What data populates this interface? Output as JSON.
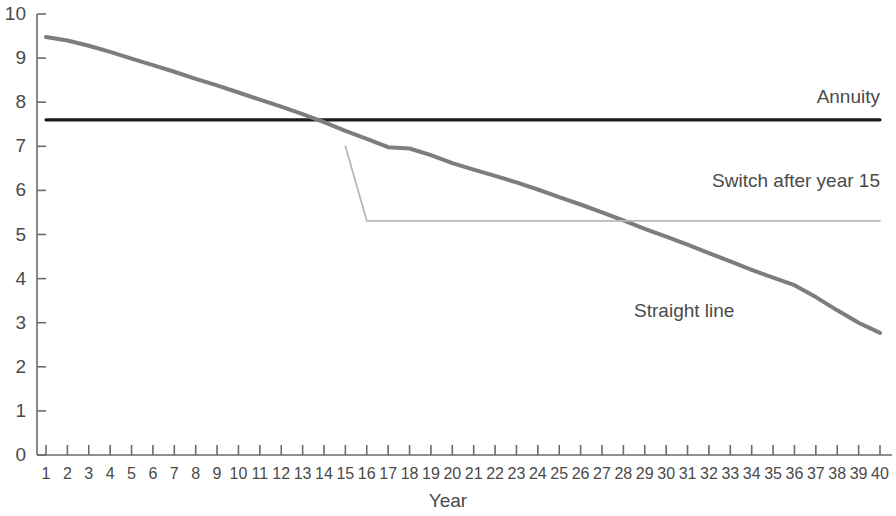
{
  "chart_data": {
    "type": "line",
    "title": "",
    "xlabel": "Year",
    "ylabel": "",
    "xlim": [
      1,
      40
    ],
    "ylim": [
      0,
      10
    ],
    "grid": false,
    "legend_position": "inline-annotations",
    "x": [
      1,
      2,
      3,
      4,
      5,
      6,
      7,
      8,
      9,
      10,
      11,
      12,
      13,
      14,
      15,
      16,
      17,
      18,
      19,
      20,
      21,
      22,
      23,
      24,
      25,
      26,
      27,
      28,
      29,
      30,
      31,
      32,
      33,
      34,
      35,
      36,
      37,
      38,
      39,
      40
    ],
    "xtick_labels": [
      "1",
      "2",
      "3",
      "4",
      "5",
      "6",
      "7",
      "8",
      "9",
      "10",
      "11",
      "12",
      "13",
      "14",
      "15",
      "16",
      "17",
      "18",
      "19",
      "20",
      "21",
      "22",
      "23",
      "24",
      "25",
      "26",
      "27",
      "28",
      "29",
      "30",
      "31",
      "32",
      "33",
      "34",
      "35",
      "36",
      "37",
      "38",
      "39",
      "40"
    ],
    "ytick_labels": [
      "0",
      "1",
      "2",
      "3",
      "4",
      "5",
      "6",
      "7",
      "8",
      "9",
      "10"
    ],
    "ytick_values": [
      0,
      1,
      2,
      3,
      4,
      5,
      6,
      7,
      8,
      9,
      10
    ],
    "series": [
      {
        "name": "Annuity",
        "color": "#1a1a1a",
        "width": 3.2,
        "label_x": 40,
        "label_y": 8.1,
        "values": [
          7.6,
          7.6,
          7.6,
          7.6,
          7.6,
          7.6,
          7.6,
          7.6,
          7.6,
          7.6,
          7.6,
          7.6,
          7.6,
          7.6,
          7.6,
          7.6,
          7.6,
          7.6,
          7.6,
          7.6,
          7.6,
          7.6,
          7.6,
          7.6,
          7.6,
          7.6,
          7.6,
          7.6,
          7.6,
          7.6,
          7.6,
          7.6,
          7.6,
          7.6,
          7.6,
          7.6,
          7.6,
          7.6,
          7.6,
          7.6
        ]
      },
      {
        "name": "Straight line",
        "color": "#7d7d7d",
        "width": 4.0,
        "label_x": 28.5,
        "label_y": 3.25,
        "values": [
          9.48,
          9.4,
          9.28,
          9.14,
          8.99,
          8.84,
          8.69,
          8.53,
          8.38,
          8.22,
          8.06,
          7.9,
          7.73,
          7.55,
          7.35,
          7.17,
          6.98,
          6.95,
          6.8,
          6.62,
          6.47,
          6.33,
          6.18,
          6.02,
          5.85,
          5.68,
          5.5,
          5.32,
          5.13,
          4.95,
          4.77,
          4.58,
          4.39,
          4.2,
          4.02,
          3.85,
          3.58,
          3.28,
          3.0,
          2.77
        ]
      },
      {
        "name": "Switch after year 15",
        "color": "#b8b8b8",
        "width": 1.8,
        "label_x": 40,
        "label_y": 6.2,
        "values": [
          null,
          null,
          null,
          null,
          null,
          null,
          null,
          null,
          null,
          null,
          null,
          null,
          null,
          null,
          7.0,
          5.31,
          5.31,
          5.31,
          5.31,
          5.31,
          5.31,
          5.31,
          5.31,
          5.31,
          5.31,
          5.31,
          5.31,
          5.31,
          5.31,
          5.31,
          5.31,
          5.31,
          5.31,
          5.31,
          5.31,
          5.31,
          5.31,
          5.31,
          5.31,
          5.31
        ]
      }
    ],
    "annotations": [
      {
        "text": "Annuity",
        "series": "Annuity"
      },
      {
        "text": "Switch after year 15",
        "series": "Switch after year 15"
      },
      {
        "text": "Straight line",
        "series": "Straight line"
      }
    ]
  },
  "axes": {
    "x_axis_title": "Year",
    "axis_color": "#6b6b6b"
  }
}
